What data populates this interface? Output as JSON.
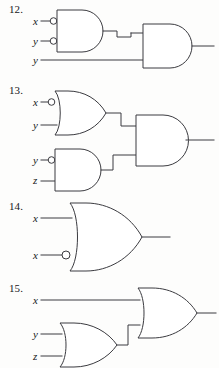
{
  "page": {
    "background_color": "#fdfdfc",
    "ink_color": "#3b3b40",
    "text_color": "#17171a"
  },
  "problems": [
    {
      "number": "12.",
      "inputs": [
        {
          "label": "x",
          "inverted": true
        },
        {
          "label": "y",
          "inverted": true
        },
        {
          "label": "y",
          "inverted": false
        }
      ],
      "gates": [
        {
          "type": "AND",
          "name": "nand-style-and-gate-1",
          "inverted_inputs": [
            true,
            true
          ]
        },
        {
          "type": "AND",
          "name": "and-gate-output",
          "inverted_inputs": [
            false,
            false
          ]
        }
      ],
      "output": {
        "label": ""
      }
    },
    {
      "number": "13.",
      "inputs": [
        {
          "label": "x",
          "inverted": true
        },
        {
          "label": "y",
          "inverted": false
        },
        {
          "label": "y",
          "inverted": true
        },
        {
          "label": "z",
          "inverted": false
        }
      ],
      "gates": [
        {
          "type": "OR",
          "name": "or-gate-top",
          "inverted_inputs": [
            true,
            false
          ]
        },
        {
          "type": "AND",
          "name": "and-gate-bottom",
          "inverted_inputs": [
            true,
            false
          ]
        },
        {
          "type": "AND",
          "name": "and-gate-output",
          "inverted_inputs": [
            false,
            false
          ]
        }
      ],
      "output": {
        "label": ""
      }
    },
    {
      "number": "14.",
      "inputs": [
        {
          "label": "x",
          "inverted": false
        },
        {
          "label": "x",
          "inverted": true
        }
      ],
      "gates": [
        {
          "type": "OR",
          "name": "or-gate-output",
          "inverted_inputs": [
            false,
            true
          ]
        }
      ],
      "output": {
        "label": ""
      }
    },
    {
      "number": "15.",
      "inputs": [
        {
          "label": "x",
          "inverted": false
        },
        {
          "label": "y",
          "inverted": false
        },
        {
          "label": "z",
          "inverted": false
        }
      ],
      "gates": [
        {
          "type": "OR",
          "name": "or-gate-lower",
          "inverted_inputs": [
            false,
            false
          ]
        },
        {
          "type": "OR",
          "name": "or-gate-output",
          "inverted_inputs": [
            false,
            false
          ]
        }
      ],
      "output": {
        "label": ""
      }
    }
  ]
}
